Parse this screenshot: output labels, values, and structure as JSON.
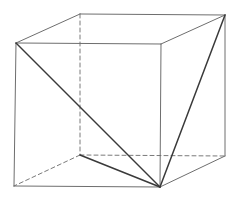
{
  "diagram": {
    "type": "cube-with-triangle",
    "background": "#ffffff",
    "colors": {
      "edge": "#6e6e6e",
      "hidden_edge": "#7a7a7a",
      "diagonal": "#3a3a3a"
    },
    "vertices": {
      "front_top_left": [
        16,
        43
      ],
      "front_top_right": [
        161,
        44
      ],
      "front_bottom_left": [
        14,
        186
      ],
      "front_bottom_right": [
        160,
        187
      ],
      "back_top_left": [
        80,
        14
      ],
      "back_top_right": [
        225,
        15
      ],
      "back_bottom_left": [
        80,
        155
      ],
      "back_bottom_right": [
        225,
        156
      ]
    },
    "visible_edges": [
      [
        "front_top_left",
        "front_top_right"
      ],
      [
        "front_top_right",
        "front_bottom_right"
      ],
      [
        "front_bottom_right",
        "front_bottom_left"
      ],
      [
        "front_bottom_left",
        "front_top_left"
      ],
      [
        "front_top_left",
        "back_top_left"
      ],
      [
        "back_top_left",
        "back_top_right"
      ],
      [
        "back_top_right",
        "front_top_right"
      ],
      [
        "back_top_right",
        "back_bottom_right"
      ],
      [
        "back_bottom_right",
        "front_bottom_right"
      ]
    ],
    "hidden_edges": [
      [
        "back_top_left",
        "back_bottom_left"
      ],
      [
        "back_bottom_left",
        "front_bottom_left"
      ],
      [
        "back_bottom_left",
        "back_bottom_right"
      ]
    ],
    "diagonals": [
      [
        "front_top_left",
        "front_bottom_right"
      ],
      [
        "back_top_right",
        "front_bottom_right"
      ],
      [
        "back_bottom_left",
        "front_bottom_right"
      ]
    ]
  }
}
